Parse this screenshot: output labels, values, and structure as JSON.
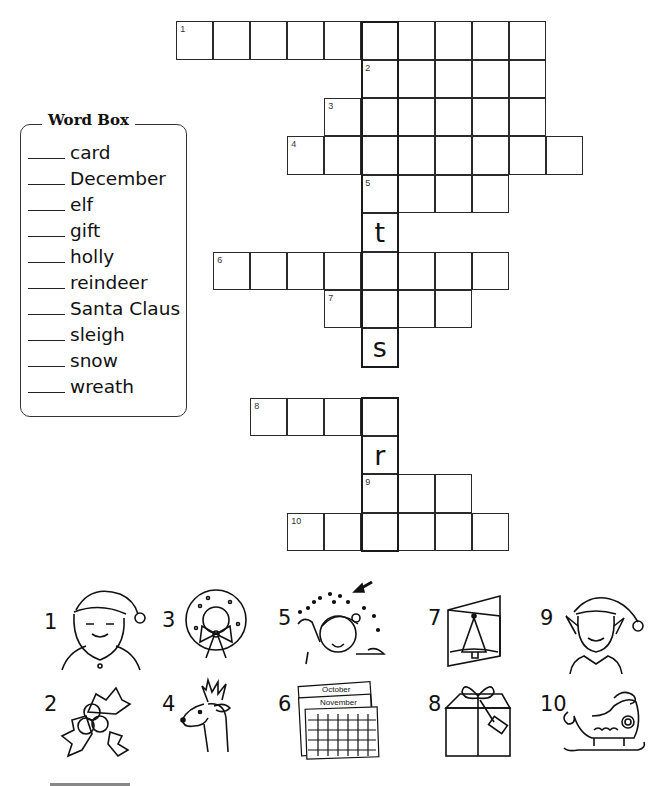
{
  "puzzle": {
    "grid": {
      "origin_x": 177,
      "origin_y": 22,
      "cell_w": 37,
      "cell_h": 38.4,
      "highlight_column": 5,
      "rows": [
        {
          "row": 0,
          "start_col": 0,
          "length": 10,
          "clue_number": "1"
        },
        {
          "row": 1,
          "start_col": 5,
          "length": 5,
          "clue_number": "2"
        },
        {
          "row": 2,
          "start_col": 4,
          "length": 6,
          "clue_number": "3"
        },
        {
          "row": 3,
          "start_col": 3,
          "length": 8,
          "clue_number": "4"
        },
        {
          "row": 4,
          "start_col": 5,
          "length": 4,
          "clue_number": "5"
        },
        {
          "row": 5,
          "start_col": 5,
          "length": 1,
          "given_letter": "t"
        },
        {
          "row": 6,
          "start_col": 1,
          "length": 8,
          "clue_number": "6"
        },
        {
          "row": 7,
          "start_col": 4,
          "length": 4,
          "clue_number": "7"
        },
        {
          "row": 8,
          "start_col": 5,
          "length": 1,
          "given_letter": "s"
        },
        {
          "row": 9.8,
          "start_col": 2,
          "length": 4,
          "clue_number": "8"
        },
        {
          "row": 10.8,
          "start_col": 5,
          "length": 1,
          "given_letter": "r"
        },
        {
          "row": 11.8,
          "start_col": 5,
          "length": 3,
          "clue_number": "9"
        },
        {
          "row": 12.8,
          "start_col": 3,
          "length": 6,
          "clue_number": "10"
        }
      ]
    }
  },
  "word_box": {
    "title": "Word Box",
    "items": [
      {
        "label": "card"
      },
      {
        "label": "December"
      },
      {
        "label": "elf"
      },
      {
        "label": "gift"
      },
      {
        "label": "holly"
      },
      {
        "label": "reindeer"
      },
      {
        "label": "Santa Claus"
      },
      {
        "label": "sleigh"
      },
      {
        "label": "snow"
      },
      {
        "label": "wreath"
      }
    ]
  },
  "picture_clues": [
    {
      "number": "1",
      "icon": "santa-claus-icon"
    },
    {
      "number": "3",
      "icon": "wreath-icon"
    },
    {
      "number": "5",
      "icon": "snow-child-icon"
    },
    {
      "number": "7",
      "icon": "christmas-card-icon"
    },
    {
      "number": "9",
      "icon": "elf-icon"
    },
    {
      "number": "2",
      "icon": "holly-icon"
    },
    {
      "number": "4",
      "icon": "reindeer-icon"
    },
    {
      "number": "6",
      "icon": "calendar-december-icon",
      "calendar_labels": [
        "October",
        "November"
      ]
    },
    {
      "number": "8",
      "icon": "gift-icon"
    },
    {
      "number": "10",
      "icon": "sleigh-icon"
    }
  ]
}
